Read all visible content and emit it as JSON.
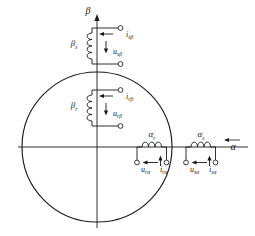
{
  "figure": {
    "type": "phasor-coil-diagram",
    "background_color": "#ffffff",
    "line_color": "#1a1a1a"
  },
  "axes": {
    "vertical": {
      "label": "β",
      "name": "beta-axis",
      "arrow": "up"
    },
    "horizontal": {
      "label": "α",
      "name": "alpha-axis",
      "arrow": "left-overbar"
    }
  },
  "circle": {
    "name": "rotor-circle",
    "center_x": 97,
    "center_y": 147,
    "radius": 75
  },
  "coils": [
    {
      "id": "stator-beta",
      "name": "coil-beta-s",
      "orientation": "vertical",
      "label": "β",
      "label_sub": "s",
      "current_label": "i",
      "current_sub": "sβ",
      "voltage_label": "u",
      "voltage_sub": "sβ"
    },
    {
      "id": "rotor-beta",
      "name": "coil-beta-r",
      "orientation": "vertical",
      "label": "β",
      "label_sub": "r",
      "current_label": "i",
      "current_sub": "rβ",
      "voltage_label": "u",
      "voltage_sub": "rβ"
    },
    {
      "id": "rotor-alpha",
      "name": "coil-alpha-r",
      "orientation": "horizontal",
      "label": "α",
      "label_sub": "r",
      "current_label": "i",
      "current_sub": "rα",
      "voltage_label": "u",
      "voltage_sub": "rα"
    },
    {
      "id": "stator-alpha",
      "name": "coil-alpha-s",
      "orientation": "horizontal",
      "label": "α",
      "label_sub": "s",
      "current_label": "i",
      "current_sub": "sα",
      "voltage_label": "u",
      "voltage_sub": "sα"
    }
  ]
}
